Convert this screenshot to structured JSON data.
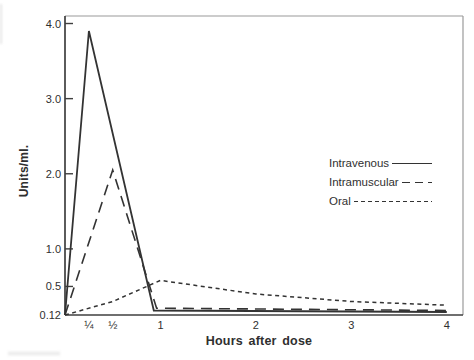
{
  "figure": {
    "background": "#ffffff",
    "ink_color": "#333333"
  },
  "legend": {
    "items": [
      {
        "label": "Intravenous",
        "line_style": "solid"
      },
      {
        "label": "Intramuscular",
        "line_style": "long-dash"
      },
      {
        "label": "Oral",
        "line_style": "short-dash"
      }
    ]
  },
  "chart_data": {
    "type": "line",
    "title": "",
    "xlabel": "Hours after dose",
    "ylabel": "Units/ml.",
    "xlim": [
      0,
      4.17
    ],
    "ylim": [
      0.12,
      4.1
    ],
    "grid": false,
    "legend_position": "right-center",
    "x_ticks": [
      {
        "value": 0.25,
        "label": "¼"
      },
      {
        "value": 0.5,
        "label": "½"
      },
      {
        "value": 1,
        "label": "1"
      },
      {
        "value": 2,
        "label": "2"
      },
      {
        "value": 3,
        "label": "3"
      },
      {
        "value": 4,
        "label": "4"
      }
    ],
    "y_ticks": [
      {
        "value": 0.12,
        "label": "0.12"
      },
      {
        "value": 0.5,
        "label": "0.5"
      },
      {
        "value": 1.0,
        "label": "1.0"
      },
      {
        "value": 2.0,
        "label": "2.0"
      },
      {
        "value": 3.0,
        "label": "3.0"
      },
      {
        "value": 4.0,
        "label": "4.0"
      }
    ],
    "series": [
      {
        "name": "Intravenous",
        "line_style": "solid",
        "points": [
          [
            0,
            0.12
          ],
          [
            0.25,
            3.9
          ],
          [
            0.93,
            0.18
          ],
          [
            4,
            0.16
          ]
        ]
      },
      {
        "name": "Intramuscular",
        "line_style": "long-dash",
        "points": [
          [
            0,
            0.12
          ],
          [
            0.5,
            2.05
          ],
          [
            0.96,
            0.21
          ],
          [
            4,
            0.18
          ]
        ]
      },
      {
        "name": "Oral",
        "line_style": "short-dash",
        "points": [
          [
            0,
            0.12
          ],
          [
            0.5,
            0.3
          ],
          [
            1,
            0.58
          ],
          [
            2,
            0.4
          ],
          [
            3,
            0.3
          ],
          [
            4,
            0.25
          ]
        ]
      }
    ]
  }
}
